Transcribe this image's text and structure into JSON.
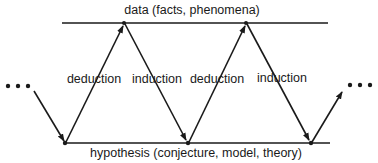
{
  "diagram": {
    "top_label": "data (facts, phenomena)",
    "bottom_label": "hypothesis (conjecture, model, theory)",
    "edge_labels": [
      "deduction",
      "induction",
      "deduction",
      "induction"
    ],
    "left_ellipsis": "•••",
    "right_ellipsis": "•••",
    "colors": {
      "stroke": "#1a1a1a",
      "text": "#1a1a1a",
      "background": "#ffffff"
    }
  }
}
